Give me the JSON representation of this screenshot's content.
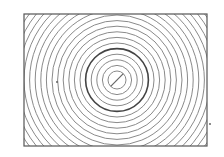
{
  "diagram": {
    "type": "concentric-circles",
    "frame": {
      "x": 24,
      "y": 14,
      "width": 183,
      "height": 132
    },
    "center": {
      "x": 117,
      "y": 80
    },
    "inner_radius": 9,
    "spacing": 5.6,
    "ring_count": 20,
    "thick_ring_index": 4,
    "line_color": "#8a8a8a",
    "thick_color": "#444444",
    "frame_color": "#555555",
    "marks": [
      {
        "x": 57,
        "y": 82
      },
      {
        "x": 210,
        "y": 124
      }
    ]
  }
}
